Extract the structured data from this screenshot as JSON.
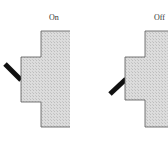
{
  "switches": [
    {
      "label": "On",
      "state": "on"
    },
    {
      "label": "Off",
      "state": "off"
    }
  ],
  "colors": {
    "body_fill": "#d9d9d9",
    "outline": "#444444",
    "toggle": "#111111"
  }
}
